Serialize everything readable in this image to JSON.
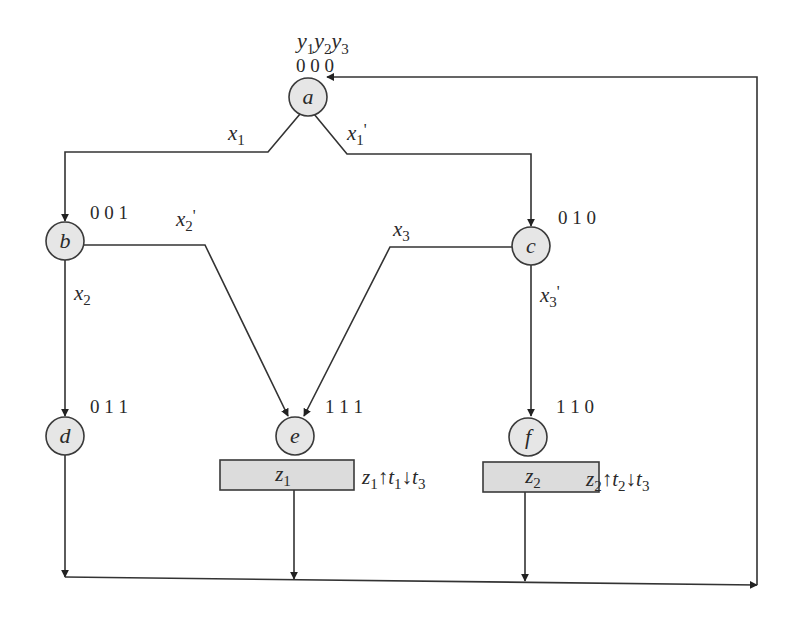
{
  "diagram": {
    "type": "ASM / state transition diagram",
    "header": {
      "state_vars": [
        "y1",
        "y2",
        "y3"
      ]
    },
    "nodes": [
      {
        "id": "a",
        "label": "a",
        "code": "0 0 0"
      },
      {
        "id": "b",
        "label": "b",
        "code": "0 0 1"
      },
      {
        "id": "c",
        "label": "c",
        "code": "0 1 0"
      },
      {
        "id": "d",
        "label": "d",
        "code": "0 1 1"
      },
      {
        "id": "e",
        "label": "e",
        "code": "1 1 1"
      },
      {
        "id": "f",
        "label": "f",
        "code": "1 1 0"
      }
    ],
    "outputs": [
      {
        "node": "e",
        "box_label": "z1",
        "action": {
          "z": "z1",
          "up": "t1",
          "down": "t3"
        }
      },
      {
        "node": "f",
        "box_label": "z2",
        "action": {
          "z": "z2",
          "up": "t2",
          "down": "t3"
        }
      }
    ],
    "edges": [
      {
        "from": "a",
        "to": "b",
        "condition": "x1"
      },
      {
        "from": "a",
        "to": "c",
        "condition": "x1'"
      },
      {
        "from": "b",
        "to": "d",
        "condition": "x2"
      },
      {
        "from": "b",
        "to": "e",
        "condition": "x2'"
      },
      {
        "from": "c",
        "to": "e",
        "condition": "x3"
      },
      {
        "from": "c",
        "to": "f",
        "condition": "x3'"
      },
      {
        "from": "d",
        "to": "a",
        "condition": ""
      },
      {
        "from": "e",
        "to": "a",
        "condition": ""
      },
      {
        "from": "f",
        "to": "a",
        "condition": ""
      }
    ]
  }
}
